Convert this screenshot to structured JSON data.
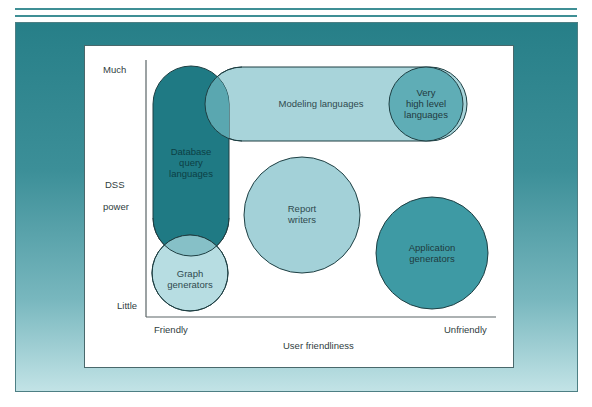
{
  "diagram": {
    "type": "overlapping-region-diagram",
    "y_axis": {
      "title_lines": [
        "DSS",
        "power"
      ],
      "top_label": "Much",
      "bottom_label": "Little"
    },
    "x_axis": {
      "title": "User friendliness",
      "left_label": "Friendly",
      "right_label": "Unfriendly"
    },
    "regions": [
      {
        "id": "database-query-languages",
        "label_lines": [
          "Database",
          "query",
          "languages"
        ],
        "shape": "vertical-pill",
        "fill": "#1f7a84",
        "text_color": "#0c3f45"
      },
      {
        "id": "modeling-languages",
        "label_lines": [
          "Modeling languages"
        ],
        "shape": "horizontal-pill",
        "fill": "#a8d4da",
        "text_color": "#2f4a4e"
      },
      {
        "id": "very-high-level-languages",
        "label_lines": [
          "Very",
          "high level",
          "languages"
        ],
        "shape": "circle",
        "fill": "#5fadb6",
        "text_color": "#1f3a3e"
      },
      {
        "id": "report-writers",
        "label_lines": [
          "Report",
          "writers"
        ],
        "shape": "circle",
        "fill": "#a3d1d8",
        "text_color": "#2f4a4e"
      },
      {
        "id": "application-generators",
        "label_lines": [
          "Application",
          "generators"
        ],
        "shape": "circle",
        "fill": "#3e9aa4",
        "text_color": "#1f3a3e"
      },
      {
        "id": "graph-generators",
        "label_lines": [
          "Graph",
          "generators"
        ],
        "shape": "circle",
        "fill": "#b7dde2",
        "text_color": "#2f4a4e"
      }
    ],
    "colors": {
      "frame_teal": "#277f88",
      "outline": "#1e3f43",
      "overlap_db_modeling": "#5aa7b0",
      "overlap_db_graph": "#86c0c7"
    }
  }
}
